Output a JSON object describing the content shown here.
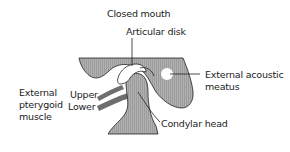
{
  "diagram": {
    "title": "Closed mouth",
    "labels": {
      "title": "Closed mouth",
      "articular_disk": "Articular disk",
      "external_acoustic_meatus_line1": "External acoustic",
      "external_acoustic_meatus_line2": "meatus",
      "external_pterygoid_line1": "External",
      "external_pterygoid_line2": "pterygoid",
      "external_pterygoid_line3": "muscle",
      "upper": "Upper",
      "lower": "Lower",
      "condylar_head": "Condylar head"
    },
    "colors": {
      "bone": "#a8a8a8",
      "muscle": "#6e6e6e",
      "outline": "#222222",
      "disk": "#ffffff",
      "background": "#ffffff"
    }
  }
}
